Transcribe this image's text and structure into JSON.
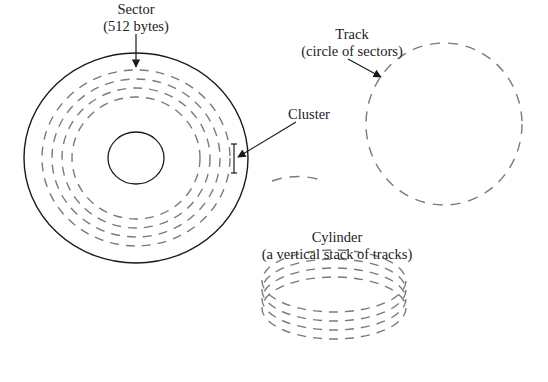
{
  "diagram": {
    "colors": {
      "solid_line": "#1a1a1a",
      "dashed_line": "#7a7a7a",
      "text": "#222222",
      "background": "#ffffff"
    },
    "labels": {
      "sector": {
        "line1": "Sector",
        "line2": "(512 bytes)"
      },
      "cluster": {
        "line1": "Cluster"
      },
      "track": {
        "line1": "Track",
        "line2": "(circle of sectors)"
      },
      "cylinder": {
        "line1": "Cylinder",
        "line2": "(a vertical stack of tracks)"
      }
    },
    "components": [
      {
        "name": "disk-platter",
        "description": "Solid outer circle with solid inner hub and 4 concentric dashed tracks"
      },
      {
        "name": "track",
        "description": "Single dashed circle"
      },
      {
        "name": "sector-fragment",
        "description": "Short dashed arc segment"
      },
      {
        "name": "cylinder",
        "description": "Stack of 4 dashed ellipses"
      }
    ]
  }
}
